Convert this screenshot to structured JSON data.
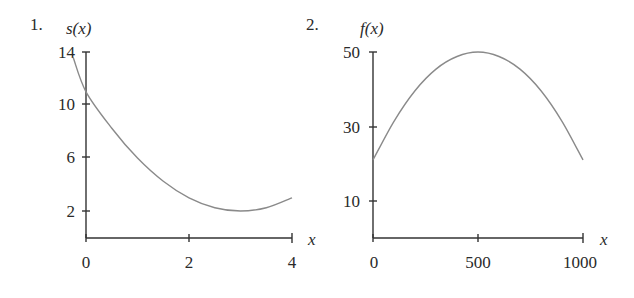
{
  "chart_data": [
    {
      "type": "line",
      "number_label": "1.",
      "ylabel": "s(x)",
      "xlabel": "x",
      "x_ticks": [
        0,
        2,
        4
      ],
      "y_ticks": [
        2,
        6,
        10,
        14
      ],
      "xlim": [
        -0.25,
        4
      ],
      "ylim": [
        0,
        14
      ],
      "grid": false,
      "series": [
        {
          "name": "s(x)",
          "x": [
            -0.25,
            0,
            0.5,
            1,
            1.5,
            2,
            2.5,
            3,
            3.5,
            4
          ],
          "values": [
            13.6,
            11,
            8.25,
            6,
            4.25,
            3,
            2.25,
            2,
            2.25,
            3
          ]
        }
      ],
      "color": "#8a8a8a"
    },
    {
      "type": "line",
      "number_label": "2.",
      "ylabel": "f(x)",
      "xlabel": "x",
      "x_ticks": [
        0,
        500,
        1000
      ],
      "y_ticks": [
        10,
        30,
        50
      ],
      "xlim": [
        0,
        1000
      ],
      "ylim": [
        0,
        50
      ],
      "grid": false,
      "series": [
        {
          "name": "f(x)",
          "x": [
            0,
            100,
            200,
            300,
            400,
            500,
            600,
            700,
            800,
            900,
            1000
          ],
          "values": [
            21,
            31.4,
            39.6,
            45.4,
            48.8,
            50,
            48.8,
            45.4,
            39.6,
            31.4,
            21
          ]
        }
      ],
      "color": "#8a8a8a"
    }
  ]
}
